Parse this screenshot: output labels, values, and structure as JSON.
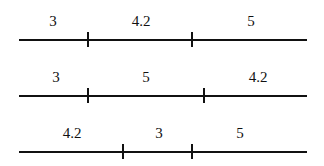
{
  "diagram": {
    "rows": [
      {
        "segments": [
          {
            "label": "3",
            "from": 19,
            "to": 88
          },
          {
            "label": "4.2",
            "from": 88,
            "to": 192
          },
          {
            "label": "5",
            "from": 192,
            "to": 307
          }
        ],
        "ticks": [
          88,
          192
        ]
      },
      {
        "segments": [
          {
            "label": "3",
            "from": 19,
            "to": 88
          },
          {
            "label": "5",
            "from": 88,
            "to": 204
          },
          {
            "label": "4.2",
            "from": 204,
            "to": 307
          }
        ],
        "ticks": [
          88,
          204
        ]
      },
      {
        "segments": [
          {
            "label": "4.2",
            "from": 19,
            "to": 123
          },
          {
            "label": "3",
            "from": 123,
            "to": 192
          },
          {
            "label": "5",
            "from": 192,
            "to": 307
          }
        ],
        "ticks": [
          123,
          192
        ]
      }
    ],
    "line_color": "#111111"
  }
}
